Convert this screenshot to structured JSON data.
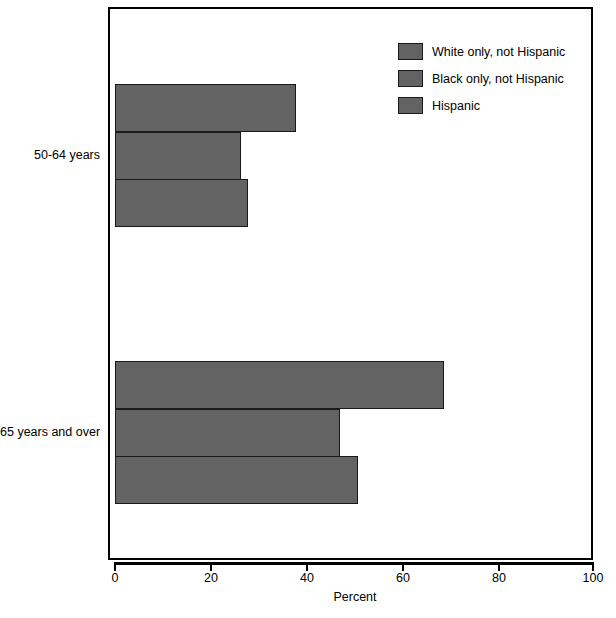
{
  "chart_data": {
    "type": "bar",
    "orientation": "horizontal",
    "title": "",
    "xlabel": "Percent",
    "ylabel": "",
    "xlim": [
      0,
      100
    ],
    "xticks": [
      0,
      20,
      40,
      60,
      80,
      100
    ],
    "xtick_labels": [
      "0",
      "20",
      "40",
      "60",
      "80",
      "100"
    ],
    "categories": [
      "50-64 years",
      "65 years and over"
    ],
    "grid": false,
    "legend_position": "top-right",
    "series": [
      {
        "name": "White only, not Hispanic",
        "color": "#636363",
        "values": [
          37.7,
          68.5
        ]
      },
      {
        "name": "Black only, not Hispanic",
        "color": "#636363",
        "values": [
          26.3,
          46.9
        ]
      },
      {
        "name": "Hispanic",
        "color": "#636363",
        "values": [
          27.7,
          50.7
        ]
      }
    ]
  },
  "legend": {
    "items": [
      {
        "label": "White only, not Hispanic",
        "color": "#636363"
      },
      {
        "label": "Black only, not Hispanic",
        "color": "#636363"
      },
      {
        "label": "Hispanic",
        "color": "#636363"
      }
    ]
  },
  "axis": {
    "x_title": "Percent",
    "x_tick_labels": [
      "0",
      "20",
      "40",
      "60",
      "80",
      "100"
    ]
  },
  "categories": [
    {
      "label": "50-64 years"
    },
    {
      "label": "65 years and over"
    }
  ],
  "colors": {
    "bar_fill": "#636363",
    "bar_border": "#1a1a1a",
    "frame": "#000000",
    "background": "#ffffff",
    "text": "#000000"
  }
}
